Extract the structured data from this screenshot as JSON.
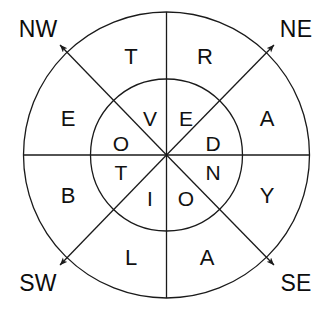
{
  "figure": {
    "center": {
      "x": 166.5,
      "y": 155
    },
    "outer_radius": 143,
    "inner_radius": 76,
    "stroke_color": "#1a1a1a",
    "background_color": "#ffffff",
    "stroke_width": 1.3
  },
  "compass_labels": [
    {
      "name": "nw",
      "text": "NW",
      "x": 38,
      "y": 29
    },
    {
      "name": "ne",
      "text": "NE",
      "x": 296,
      "y": 29
    },
    {
      "name": "sw",
      "text": "SW",
      "x": 38,
      "y": 283
    },
    {
      "name": "se",
      "text": "SE",
      "x": 296,
      "y": 283
    }
  ],
  "arrows": [
    {
      "name": "arrow-nw",
      "from_x": 166.5,
      "from_y": 155,
      "to_x": 59,
      "to_y": 44,
      "direction": "NW"
    },
    {
      "name": "arrow-ne",
      "from_x": 166.5,
      "from_y": 155,
      "to_x": 275,
      "to_y": 44,
      "direction": "NE"
    },
    {
      "name": "arrow-sw",
      "from_x": 166.5,
      "from_y": 155,
      "to_x": 59,
      "to_y": 266,
      "direction": "SW"
    },
    {
      "name": "arrow-se",
      "from_x": 166.5,
      "from_y": 155,
      "to_x": 275,
      "to_y": 266,
      "direction": "SE"
    }
  ],
  "outer_ring": {
    "sequence": "TRAYALBE",
    "letters": [
      {
        "name": "outer-letter-t",
        "text": "T",
        "x": 131,
        "y": 57,
        "sector": "north-west-of-north"
      },
      {
        "name": "outer-letter-r",
        "text": "R",
        "x": 205,
        "y": 57,
        "sector": "north-east-of-north"
      },
      {
        "name": "outer-letter-a-ne",
        "text": "A",
        "x": 267,
        "y": 119,
        "sector": "east-north"
      },
      {
        "name": "outer-letter-y",
        "text": "Y",
        "x": 267,
        "y": 196,
        "sector": "east-south"
      },
      {
        "name": "outer-letter-a-se",
        "text": "A",
        "x": 207,
        "y": 258,
        "sector": "south-east-of-south"
      },
      {
        "name": "outer-letter-l",
        "text": "L",
        "x": 131,
        "y": 258,
        "sector": "south-west-of-south"
      },
      {
        "name": "outer-letter-b",
        "text": "B",
        "x": 68,
        "y": 196,
        "sector": "west-south"
      },
      {
        "name": "outer-letter-e",
        "text": "E",
        "x": 68,
        "y": 119,
        "sector": "west-north"
      }
    ]
  },
  "inner_ring": {
    "sequence": "VEDNOITO",
    "letters": [
      {
        "name": "inner-letter-v",
        "text": "V",
        "x": 150,
        "y": 118,
        "sector": "north-west-of-north"
      },
      {
        "name": "inner-letter-e",
        "text": "E",
        "x": 186,
        "y": 118,
        "sector": "north-east-of-north"
      },
      {
        "name": "inner-letter-d",
        "text": "D",
        "x": 213,
        "y": 143,
        "sector": "east-north"
      },
      {
        "name": "inner-letter-n",
        "text": "N",
        "x": 213,
        "y": 172,
        "sector": "east-south"
      },
      {
        "name": "inner-letter-o-south",
        "text": "O",
        "x": 186,
        "y": 198,
        "sector": "south-east-of-south"
      },
      {
        "name": "inner-letter-i",
        "text": "I",
        "x": 150,
        "y": 198,
        "sector": "south-west-of-south"
      },
      {
        "name": "inner-letter-t",
        "text": "T",
        "x": 121,
        "y": 172,
        "sector": "west-south"
      },
      {
        "name": "inner-letter-o-west",
        "text": "O",
        "x": 121,
        "y": 143,
        "sector": "west-north"
      }
    ]
  }
}
